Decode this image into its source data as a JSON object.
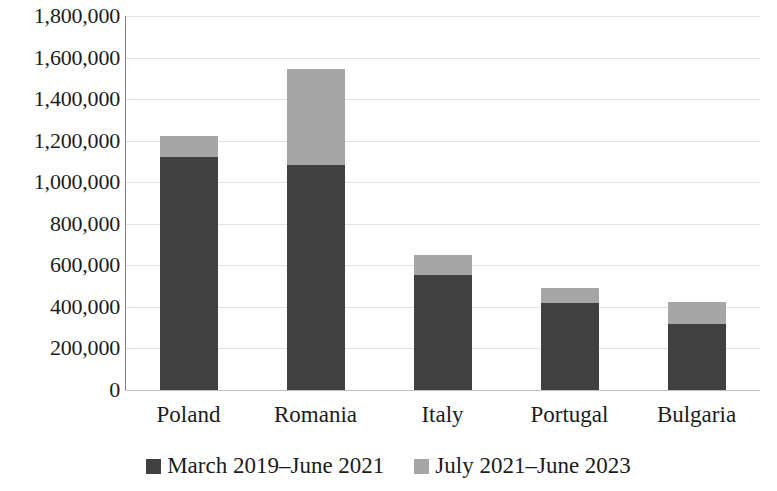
{
  "chart_data": {
    "type": "bar",
    "subtype": "stacked-bar",
    "title": "",
    "subtitle": "",
    "xlabel": "",
    "ylabel": "",
    "categories": [
      "Poland",
      "Romania",
      "Italy",
      "Portugal",
      "Bulgaria"
    ],
    "series": [
      {
        "name": "March 2019–June 2021",
        "color": "#404040",
        "values": [
          1122000,
          1083000,
          553000,
          419000,
          318000
        ]
      },
      {
        "name": "July 2021–June 2023",
        "color": "#a6a6a6",
        "values": [
          101000,
          463000,
          97000,
          72000,
          106000
        ]
      }
    ],
    "totals": [
      1223000,
      1546000,
      650000,
      491000,
      424000
    ],
    "ylim": [
      0,
      1800000
    ],
    "ytick_step": 200000,
    "ytick_labels": [
      "1,800,000",
      "1,600,000",
      "1,400,000",
      "1,200,000",
      "1,000,000",
      "800,000",
      "600,000",
      "400,000",
      "200,000",
      "0"
    ],
    "ytick_values": [
      1800000,
      1600000,
      1400000,
      1200000,
      1000000,
      800000,
      600000,
      400000,
      200000,
      0
    ],
    "grid": true,
    "grid_axis": "y",
    "legend_position": "bottom",
    "legend": [
      {
        "label": "March 2019–June 2021",
        "color": "#404040"
      },
      {
        "label": "July 2021–June 2023",
        "color": "#a6a6a6"
      }
    ]
  },
  "colors": {
    "series_dark": "#404040",
    "series_light": "#a6a6a6",
    "gridline": "#e2e2e2",
    "axis": "#7f7f7f",
    "text": "#1c1c1c",
    "background": "#ffffff"
  }
}
